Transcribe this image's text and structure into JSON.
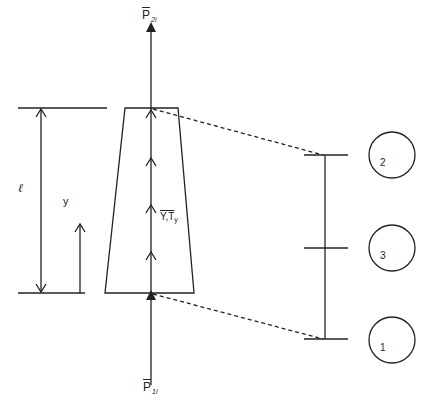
{
  "diagram": {
    "type": "tapered bar element with nodal loads and three-node discretization",
    "labels": {
      "top_load": {
        "symbol": "P",
        "subscript": "2i",
        "overbar": true
      },
      "bottom_load": {
        "symbol": "P",
        "subscript": "1i",
        "overbar": true
      },
      "distributed_load": {
        "text": "Y,T",
        "subscript": "y",
        "overbar": true
      },
      "length": "ℓ",
      "coordinate": "y"
    },
    "nodes": [
      {
        "id": "2",
        "label": "2",
        "position": "top"
      },
      {
        "id": "3",
        "label": "3",
        "position": "middle"
      },
      {
        "id": "1",
        "label": "1",
        "position": "bottom"
      }
    ],
    "colors": {
      "line": "#222222",
      "background": "#ffffff"
    }
  }
}
